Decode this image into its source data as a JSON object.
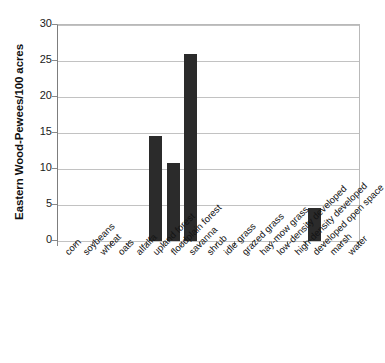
{
  "chart_data": {
    "type": "bar",
    "title": "",
    "xlabel": "",
    "ylabel": "Eastern Wood-Pewees/100 acres",
    "ylim": [
      0,
      30
    ],
    "yticks": [
      0,
      5,
      10,
      15,
      20,
      25,
      30
    ],
    "grid": true,
    "legend": "none",
    "bar_color": "#2b2b2b",
    "categories": [
      "corn",
      "soybeans",
      "wheat",
      "oats",
      "alfalfa",
      "upland forest",
      "floodplain forest",
      "savanna",
      "shrub",
      "idle grass",
      "grazed grass",
      "hay-mow grass",
      "low-density developed",
      "high-density developed",
      "developed open space",
      "marsh",
      "water"
    ],
    "values": [
      0,
      0,
      0,
      0,
      0,
      14.6,
      10.8,
      26.0,
      0,
      0,
      0,
      0,
      0,
      0,
      4.6,
      0,
      0
    ]
  }
}
